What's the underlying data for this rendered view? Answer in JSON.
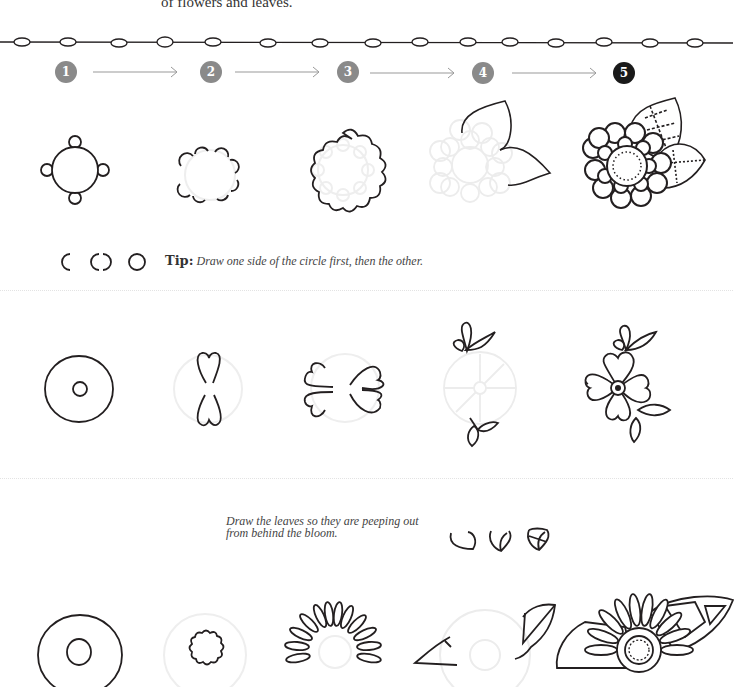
{
  "intro_text": "of flowers and leaves.",
  "steps": [
    {
      "number": "1",
      "color": "#8a8a8a"
    },
    {
      "number": "2",
      "color": "#8a8a8a"
    },
    {
      "number": "3",
      "color": "#8a8a8a"
    },
    {
      "number": "4",
      "color": "#8a8a8a"
    },
    {
      "number": "5",
      "color": "#1a1a1a"
    }
  ],
  "row1": {
    "tip_label": "Tip:",
    "tip_text": "Draw one side of the circle first, then the other."
  },
  "row3": {
    "note": "Draw the leaves so they are peeping out from behind the bloom."
  },
  "colors": {
    "ink": "#231f20",
    "guide": "#e6e6e6",
    "step_circle": "#8a8a8a",
    "step_circle_final": "#1a1a1a"
  }
}
